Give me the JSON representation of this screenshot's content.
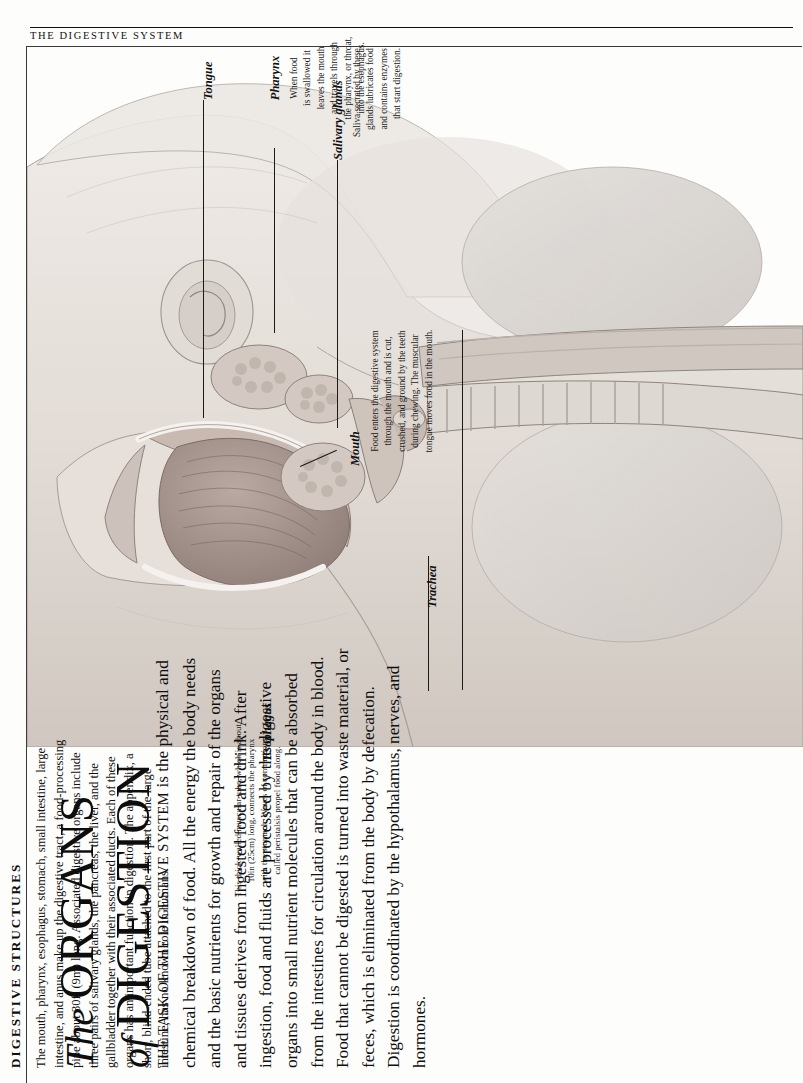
{
  "running_head": "THE DIGESTIVE SYSTEM",
  "title": {
    "line1_italic": "The",
    "line1_caps": "ORGANS",
    "line2_italic": "of",
    "line2_caps": "DIGESTION"
  },
  "intro": {
    "lead_caps": "THE TASK OF THE DIGESTIVE SYSTEM",
    "text": " is the physical and chemical breakdown of food. All the energy the body needs and the basic nutrients for growth and repair of the organs and tissues derives from ingested food and drink. After ingestion, food and fluids are processed by the digestive organs into small nutrient molecules that can be absorbed from the intestines for circulation around the body in blood. Food that cannot be digested is turned into waste material, or feces, which is eliminated from the body by defecation. Digestion is coordinated by the hypothalamus, nerves, and hormones."
  },
  "section": {
    "heading": "DIGESTIVE STRUCTURES",
    "text": "The mouth, pharynx, esophagus, stomach, small intestine, large intestine, and anus make up the digestive tract, a food-processing pipe about 30ft (9m) long. Associated digestive organs include three pairs of salivary glands, the pancreas, the liver, and the gallbladder together with their associated ducts. Each of these organs has an important function in digestion. The appendix, a short, blind-ended tube attached to the first part of the large intestine, has no known role in humans."
  },
  "callouts": [
    {
      "id": "tongue",
      "label": "Tongue",
      "caption": ""
    },
    {
      "id": "pharynx",
      "label": "Pharynx",
      "caption": "When food\nis swallowed it\nleaves the mouth\nand travels through\nthe pharynx, or throat,\ninto the esophagus."
    },
    {
      "id": "salivary-glands",
      "label": "Salivary glands",
      "caption": "Saliva secreted by these\nglands lubricates food\nand contains enzymes\nthat start digestion."
    },
    {
      "id": "mouth",
      "label": "Mouth",
      "caption": "Food enters the digestive system\nthrough the mouth and is cut,\ncrushed, and ground by the teeth\nduring chewing. The muscular\ntongue moves food in the mouth."
    },
    {
      "id": "trachea",
      "label": "Trachea",
      "caption": ""
    },
    {
      "id": "esophagus",
      "label": "Esophagus",
      "caption": "This thick-walled muscular tube, which is about\n10in (25cm) long, connects the pharynx\nwith the stomach. Waves of contractions\ncalled peristalsis propel food along."
    }
  ],
  "illustration": {
    "alt": "Sagittal anatomical illustration of the head, neck and upper chest showing the mouth, tongue, pharynx, salivary glands, trachea and esophagus",
    "palette": {
      "skin_light": "#eae6e2",
      "skin_mid": "#ddd6d0",
      "skin_dark": "#c9c1ba",
      "muscle": "#b6a7a0",
      "lung": "#dcd8d4",
      "outline": "#8d857e"
    }
  }
}
